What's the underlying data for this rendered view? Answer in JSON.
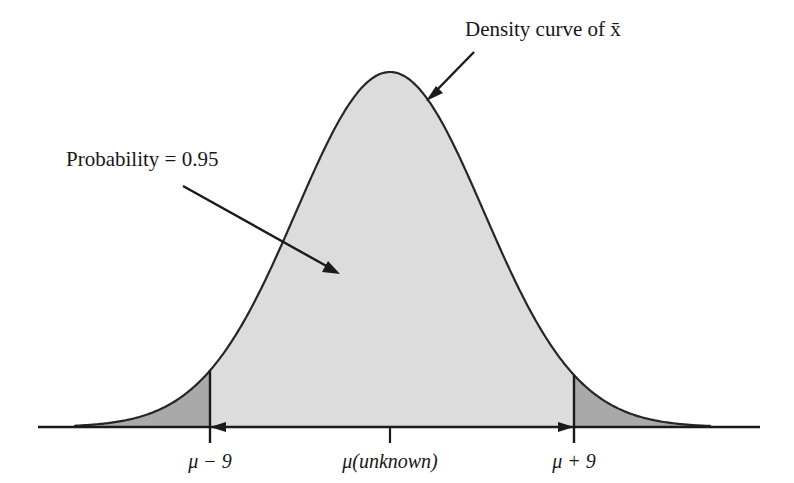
{
  "figure": {
    "title_alt": "Sampling distribution of x-bar with 95% central probability",
    "background_color": "#ffffff",
    "curve": {
      "stroke_color": "#262626",
      "body_fill": "#dcdcdc",
      "tail_fill": "#a9a9a9",
      "baseline_color": "#1a1a1a"
    },
    "annotations": [
      {
        "id": "density-curve-label",
        "text": "Density curve of x̄",
        "x": 465,
        "y": 36,
        "anchor": "start"
      },
      {
        "id": "probability-label",
        "text": "Probability = 0.95",
        "x": 66,
        "y": 166,
        "anchor": "start"
      }
    ],
    "axis": {
      "y": 427,
      "x_start": 38,
      "x_end": 760,
      "ticks": [
        {
          "id": "tick-lower",
          "label": "μ − 9",
          "x": 210,
          "label_y": 467,
          "above": true
        },
        {
          "id": "tick-center",
          "label": "μ(unknown)",
          "x": 390,
          "label_y": 467,
          "above": false
        },
        {
          "id": "tick-upper",
          "label": "μ + 9",
          "x": 574,
          "label_y": 467,
          "above": true
        }
      ],
      "interval_arrow": {
        "id": "confidence-interval-arrow",
        "from_x": 210,
        "to_x": 574,
        "y": 427
      }
    }
  },
  "chart_data": {
    "type": "area",
    "title": "",
    "subtitle": "",
    "xlabel": "",
    "ylabel": "",
    "distribution": "normal",
    "mean": 0,
    "sigma": 4.592,
    "x_axis_ticks": [
      "μ − 9",
      "μ(unknown)",
      "μ + 9"
    ],
    "x_axis_tick_values": [
      -9,
      0,
      9
    ],
    "xlim": [
      -19.5,
      19.5
    ],
    "ylim": [
      0,
      1
    ],
    "grid": false,
    "legend": null,
    "annotations": [
      {
        "text": "Density curve of x̄",
        "points_to": "curve"
      },
      {
        "text": "Probability = 0.95",
        "points_to": "central-shaded-region"
      }
    ],
    "regions": [
      {
        "name": "central-interval",
        "from": -9,
        "to": 9,
        "probability": 0.95,
        "fill": "#dcdcdc"
      },
      {
        "name": "left-tail",
        "from": -19.5,
        "to": -9,
        "probability": 0.025,
        "fill": "#a9a9a9"
      },
      {
        "name": "right-tail",
        "from": 9,
        "to": 19.5,
        "probability": 0.025,
        "fill": "#a9a9a9"
      }
    ],
    "series": [
      {
        "name": "Density curve of x-bar",
        "x": [
          -19.5,
          -18,
          -16.5,
          -15,
          -13.5,
          -12,
          -10.5,
          -9,
          -7.5,
          -6,
          -4.5,
          -3,
          -1.5,
          0,
          1.5,
          3,
          4.5,
          6,
          7.5,
          9,
          10.5,
          12,
          13.5,
          15,
          16.5,
          18,
          19.5
        ],
        "y": [
          0.0003,
          0.0012,
          0.0039,
          0.0114,
          0.0296,
          0.0687,
          0.1425,
          0.2644,
          0.4391,
          0.6527,
          0.8683,
          1.0336,
          1.1012,
          1.1012,
          1.1012,
          1.0336,
          0.8683,
          0.6527,
          0.4391,
          0.2644,
          0.1425,
          0.0687,
          0.0296,
          0.0114,
          0.0039,
          0.0012,
          0.0003
        ]
      }
    ]
  }
}
